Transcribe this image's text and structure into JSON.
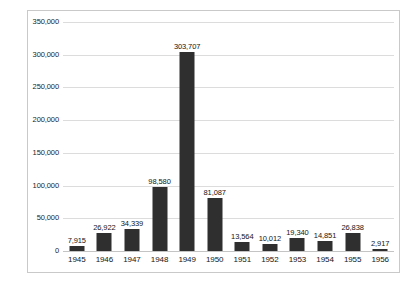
{
  "chart_data": {
    "type": "bar",
    "title": "",
    "subtitle": "",
    "xlabel": "",
    "ylabel": "",
    "grid": true,
    "legend": "none",
    "orientation": "vertical",
    "bar_color": "#2f2f2f",
    "gridline_color": "#dcdcdc",
    "frame_color": "#c9c9c9",
    "background_color": "#ffffff",
    "ylim": [
      0,
      350000
    ],
    "ytick_step": 50000,
    "categories": [
      "1945",
      "1946",
      "1947",
      "1948",
      "1949",
      "1950",
      "1951",
      "1952",
      "1953",
      "1954",
      "1955",
      "1956"
    ],
    "values": [
      7915,
      26922,
      34339,
      98580,
      303707,
      81087,
      13564,
      10012,
      19340,
      14851,
      26838,
      2917
    ],
    "value_labels": [
      "7,915",
      "26,922",
      "34,339",
      "98,580",
      "303,707",
      "81,087",
      "13,564",
      "10,012",
      "19,340",
      "14,851",
      "26,838",
      "2,917"
    ],
    "ytick_labels": [
      "0",
      "50,000",
      "100,000",
      "150,000",
      "200,000",
      "250,000",
      "300,000",
      "350,000"
    ],
    "ytick_values": [
      0,
      50000,
      100000,
      150000,
      200000,
      250000,
      300000,
      350000
    ]
  }
}
